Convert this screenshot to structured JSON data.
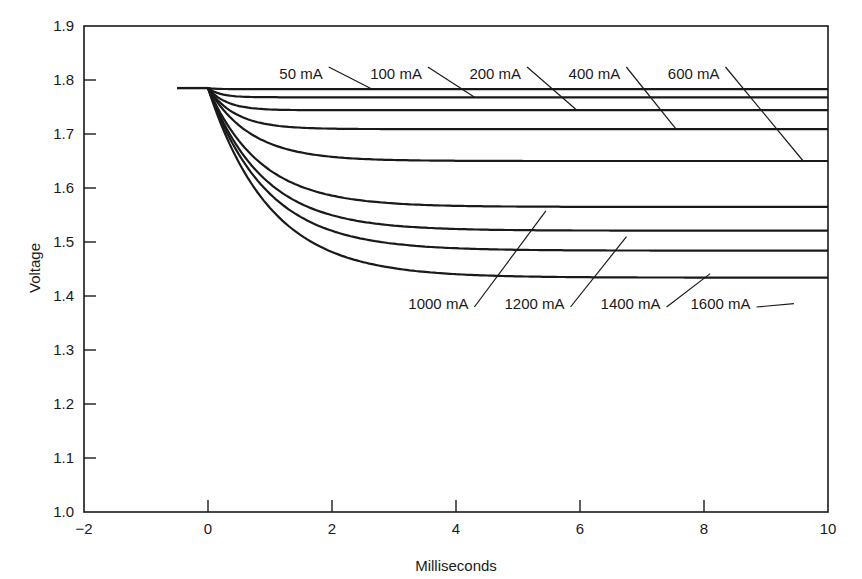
{
  "chart_data": {
    "type": "line",
    "title": "",
    "xlabel": "Milliseconds",
    "ylabel": "Voltage",
    "xlim": [
      -2,
      10
    ],
    "ylim": [
      1.0,
      1.9
    ],
    "xticks": [
      -2,
      0,
      2,
      4,
      6,
      8,
      10
    ],
    "xtick_labels": [
      "−2",
      "0",
      "2",
      "4",
      "6",
      "8",
      "10"
    ],
    "yticks": [
      1.0,
      1.1,
      1.2,
      1.3,
      1.4,
      1.5,
      1.6,
      1.7,
      1.8,
      1.9
    ],
    "ytick_labels": [
      "1.0",
      "1.1",
      "1.2",
      "1.3",
      "1.4",
      "1.5",
      "1.6",
      "1.7",
      "1.8",
      "1.9"
    ],
    "grid": false,
    "legend": "inline labels with leader lines",
    "initial_voltage": 1.785,
    "initial_segment_x": [
      -0.5,
      0
    ],
    "series": [
      {
        "name": "50 mA",
        "steady_voltage": 1.783,
        "tau_ms": 0.15,
        "label_pos": "top",
        "label_x": 1.85,
        "leader_to_x": 2.65
      },
      {
        "name": "100 mA",
        "steady_voltage": 1.768,
        "tau_ms": 0.2,
        "label_pos": "top",
        "label_x": 3.45,
        "leader_to_x": 4.3
      },
      {
        "name": "200 mA",
        "steady_voltage": 1.744,
        "tau_ms": 0.3,
        "label_pos": "top",
        "label_x": 5.05,
        "leader_to_x": 5.95
      },
      {
        "name": "400 mA",
        "steady_voltage": 1.709,
        "tau_ms": 0.45,
        "label_pos": "top",
        "label_x": 6.65,
        "leader_to_x": 7.55
      },
      {
        "name": "600 mA",
        "steady_voltage": 1.65,
        "tau_ms": 0.7,
        "label_pos": "top",
        "label_x": 8.25,
        "leader_to_x": 9.6
      },
      {
        "name": "1000 mA",
        "steady_voltage": 1.565,
        "tau_ms": 0.85,
        "label_pos": "bottom",
        "label_x": 4.2,
        "leader_to_x": 5.45
      },
      {
        "name": "1200 mA",
        "steady_voltage": 1.521,
        "tau_ms": 0.9,
        "label_pos": "bottom",
        "label_x": 5.75,
        "leader_to_x": 6.75
      },
      {
        "name": "1400 mA",
        "steady_voltage": 1.484,
        "tau_ms": 0.95,
        "label_pos": "bottom",
        "label_x": 7.3,
        "leader_to_x": 8.1
      },
      {
        "name": "1600 mA",
        "steady_voltage": 1.434,
        "tau_ms": 1.0,
        "label_pos": "bottom",
        "label_x": 8.75,
        "leader_to_x": 9.45
      }
    ]
  },
  "colors": {
    "line": "#1a1a1a",
    "background": "#ffffff"
  }
}
